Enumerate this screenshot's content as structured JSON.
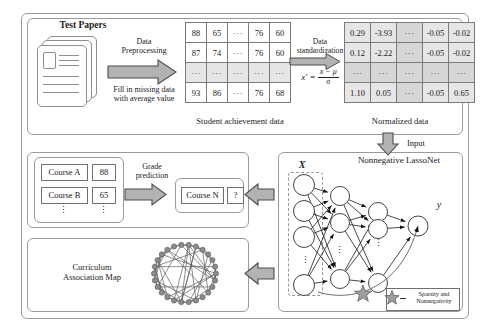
{
  "diagram": {
    "title_sections": {
      "test_papers": "Test Papers",
      "student_table_caption": "Student achievement data",
      "normalized_table_caption": "Normalized data",
      "lassonet_title": "Nonnegative LassoNet",
      "curriculum_map": "Curriculum\nAssociation Map"
    },
    "preprocessing": {
      "label_line1": "Data",
      "label_line2": "Preprocessing",
      "note_line1": "Fill in missing data",
      "note_line2": "with average value"
    },
    "standardization": {
      "label_line1": "Data",
      "label_line2": "standardization",
      "formula_lhs": "x′ =",
      "formula_numerator": "x − μ",
      "formula_denominator": "σ"
    },
    "input_arrow_label": "Input",
    "student_table": {
      "rows": [
        [
          "88",
          "65",
          "···",
          "76",
          "60"
        ],
        [
          "87",
          "74",
          "···",
          "76",
          "60"
        ],
        [
          "···",
          "···",
          "···",
          "···",
          "···"
        ],
        [
          "93",
          "86",
          "···",
          "76",
          "68"
        ]
      ]
    },
    "normalized_table": {
      "rows": [
        [
          "0.29",
          "-3.93",
          "···",
          "-0.05",
          "-0.02"
        ],
        [
          "0.12",
          "-2.22",
          "···",
          "-0.05",
          "-0.02"
        ],
        [
          "···",
          "···",
          "···",
          "···",
          "···"
        ],
        [
          "1.10",
          "0.05",
          "···",
          "-0.05",
          "0.65"
        ]
      ]
    },
    "grade_prediction": {
      "label_line1": "Grade",
      "label_line2": "prediction",
      "courses": [
        {
          "name": "Course A",
          "score": "88"
        },
        {
          "name": "Course B",
          "score": "65"
        }
      ],
      "vertical_dots": "⋮",
      "predicted": {
        "name": "Course N",
        "score": "?"
      }
    },
    "network": {
      "input_label": "X",
      "output_label": "y",
      "legend_line1": "Sparsity and",
      "legend_line2": "Nonnegativity",
      "dots_glyph": "⋮"
    },
    "colors": {
      "arrow_fill": "#b3b3b3",
      "arrow_stroke": "#4d4d4d",
      "panel_border": "#9a9a9a",
      "cell_shade": "#d6d6d6",
      "star_fill": "#9e9e9e",
      "graph_node": "#8c8c8c"
    }
  }
}
